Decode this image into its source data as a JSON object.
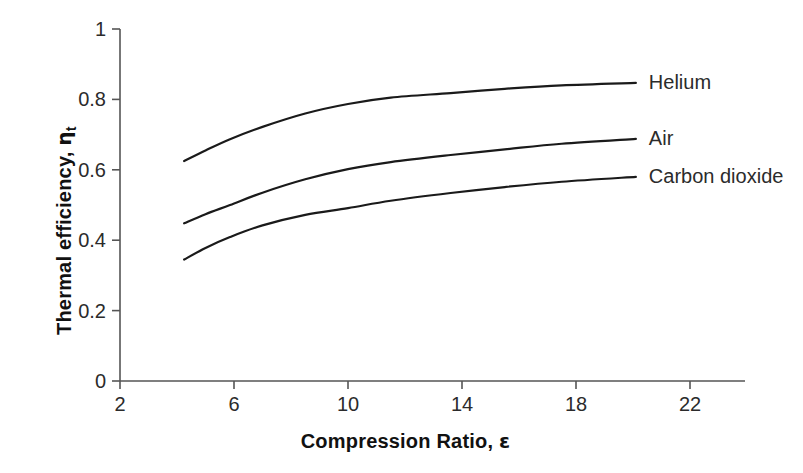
{
  "chart_data": {
    "type": "line",
    "title": "",
    "xlabel": "Compression Ratio, ε",
    "ylabel": "Thermal efficiency, ηt",
    "ylabel_main": "Thermal efficiency, ",
    "ylabel_symbol": "η",
    "ylabel_subscript": "t",
    "xlabel_main": "Compression Ratio, ",
    "xlabel_symbol": "ε",
    "xlim": [
      2,
      24
    ],
    "ylim": [
      0,
      1
    ],
    "xticks": [
      2,
      6,
      10,
      14,
      18,
      22
    ],
    "xtick_labels": [
      "2",
      "6",
      "10",
      "14",
      "18",
      "22"
    ],
    "yticks": [
      0,
      0.2,
      0.4,
      0.6,
      0.8,
      1
    ],
    "ytick_labels": [
      "0",
      "0.2",
      "0.4",
      "0.6",
      "0.8",
      "1"
    ],
    "grid": false,
    "legend_position": "right-inline-labels",
    "line_color": "#1a1a1a",
    "line_width": 2.2,
    "x": [
      4.25,
      5.0,
      5.86,
      7.0,
      8.5,
      10.0,
      11.5,
      13.6,
      15.5,
      17.5,
      20.1
    ],
    "series": [
      {
        "name": "Helium",
        "label": "Helium",
        "values": [
          0.625,
          0.655,
          0.687,
          0.722,
          0.76,
          0.787,
          0.805,
          0.818,
          0.83,
          0.84,
          0.847
        ]
      },
      {
        "name": "Air",
        "label": "Air",
        "values": [
          0.448,
          0.474,
          0.5,
          0.535,
          0.573,
          0.602,
          0.622,
          0.642,
          0.658,
          0.674,
          0.688
        ]
      },
      {
        "name": "Carbon dioxide",
        "label": "Carbon dioxide",
        "values": [
          0.345,
          0.378,
          0.409,
          0.442,
          0.472,
          0.491,
          0.512,
          0.534,
          0.551,
          0.566,
          0.58
        ]
      }
    ],
    "annotations": [
      {
        "text": "Helium",
        "x": 20.1,
        "y": 0.847
      },
      {
        "text": "Air",
        "x": 20.1,
        "y": 0.688
      },
      {
        "text": "Carbon dioxide",
        "x": 20.1,
        "y": 0.58
      }
    ]
  }
}
